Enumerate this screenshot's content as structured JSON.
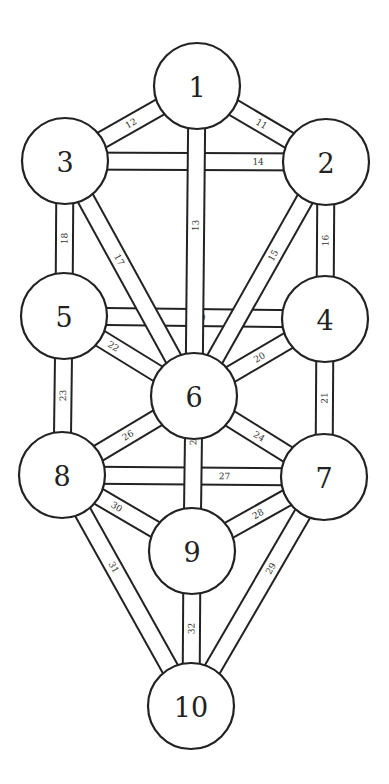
{
  "diagram": {
    "title": "",
    "colors": {
      "line": "#222222",
      "fill": "#ffffff",
      "text": "#222222"
    },
    "sphere_radius": 43,
    "path_width": 17,
    "spheres": [
      {
        "id": 1,
        "label": "1",
        "cx": 197,
        "cy": 86
      },
      {
        "id": 2,
        "label": "2",
        "cx": 326,
        "cy": 162
      },
      {
        "id": 3,
        "label": "3",
        "cx": 65,
        "cy": 161
      },
      {
        "id": 4,
        "label": "4",
        "cx": 325,
        "cy": 319
      },
      {
        "id": 5,
        "label": "5",
        "cx": 64,
        "cy": 316
      },
      {
        "id": 6,
        "label": "6",
        "cx": 194,
        "cy": 396
      },
      {
        "id": 7,
        "label": "7",
        "cx": 324,
        "cy": 477
      },
      {
        "id": 8,
        "label": "8",
        "cx": 62,
        "cy": 475
      },
      {
        "id": 9,
        "label": "9",
        "cx": 192,
        "cy": 551
      },
      {
        "id": 10,
        "label": "10",
        "cx": 191,
        "cy": 706
      }
    ],
    "paths": [
      {
        "label": "14",
        "from": 3,
        "to": 2,
        "layer": 0,
        "t": 0.74
      },
      {
        "label": "19",
        "from": 5,
        "to": 4,
        "layer": 0,
        "t": 0.52
      },
      {
        "label": "27",
        "from": 8,
        "to": 7,
        "layer": 0,
        "t": 0.62
      },
      {
        "label": "11",
        "from": 1,
        "to": 2,
        "layer": 1,
        "t": 0.5
      },
      {
        "label": "12",
        "from": 3,
        "to": 1,
        "layer": 1,
        "t": 0.5
      },
      {
        "label": "16",
        "from": 2,
        "to": 4,
        "layer": 1,
        "t": 0.5
      },
      {
        "label": "18",
        "from": 3,
        "to": 5,
        "layer": 1,
        "t": 0.5
      },
      {
        "label": "21",
        "from": 4,
        "to": 7,
        "layer": 1,
        "t": 0.5
      },
      {
        "label": "23",
        "from": 5,
        "to": 8,
        "layer": 1,
        "t": 0.5
      },
      {
        "label": "20",
        "from": 6,
        "to": 4,
        "layer": 1,
        "t": 0.5
      },
      {
        "label": "22",
        "from": 5,
        "to": 6,
        "layer": 1,
        "t": 0.38
      },
      {
        "label": "24",
        "from": 6,
        "to": 7,
        "layer": 1,
        "t": 0.5
      },
      {
        "label": "26",
        "from": 8,
        "to": 6,
        "layer": 1,
        "t": 0.5
      },
      {
        "label": "28",
        "from": 9,
        "to": 7,
        "layer": 1,
        "t": 0.5
      },
      {
        "label": "30",
        "from": 8,
        "to": 9,
        "layer": 1,
        "t": 0.42
      },
      {
        "label": "31",
        "from": 8,
        "to": 10,
        "layer": 1,
        "t": 0.4
      },
      {
        "label": "29",
        "from": 10,
        "to": 7,
        "layer": 1,
        "t": 0.6
      },
      {
        "label": "32",
        "from": 10,
        "to": 9,
        "layer": 1,
        "t": 0.5
      },
      {
        "label": "17",
        "from": 3,
        "to": 6,
        "layer": 2,
        "t": 0.42
      },
      {
        "label": "15",
        "from": 6,
        "to": 2,
        "layer": 2,
        "t": 0.6
      },
      {
        "label": "13",
        "from": 6,
        "to": 1,
        "layer": 2,
        "t": 0.55
      },
      {
        "label": "25",
        "from": 9,
        "to": 6,
        "layer": 2,
        "t": 0.72
      }
    ]
  }
}
